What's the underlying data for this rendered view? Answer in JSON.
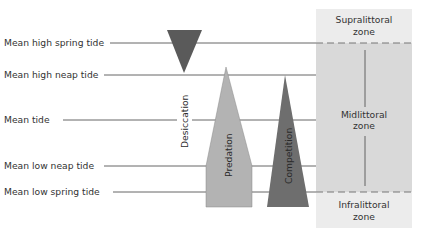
{
  "diagram": {
    "tide_levels": [
      {
        "label": "Mean high spring tide",
        "y": 43,
        "label_x": 4,
        "line_x1": 110
      },
      {
        "label": "Mean high neap tide",
        "y": 75,
        "label_x": 4,
        "line_x1": 104
      },
      {
        "label": "Mean tide",
        "y": 120,
        "label_x": 4,
        "line_x1": 63
      },
      {
        "label": "Mean low neap tide",
        "y": 166,
        "label_x": 4,
        "line_x1": 104
      },
      {
        "label": "Mean low spring tide",
        "y": 192,
        "label_x": 4,
        "line_x1": 113
      }
    ],
    "factors": [
      {
        "label": "Desiccation",
        "color": "#5a5a5a"
      },
      {
        "label": "Predation",
        "color": "#b3b3b3"
      },
      {
        "label": "Competition",
        "color": "#6e6e6e"
      }
    ],
    "zones": [
      {
        "name": "Supralittoral",
        "suffix": "zone"
      },
      {
        "name": "Midlittoral",
        "suffix": "zone"
      },
      {
        "name": "Infralittoral",
        "suffix": "zone"
      }
    ],
    "colors": {
      "zone_panel": "#e8e8e8",
      "mid_zone": "#d6d6d6",
      "line": "#555555",
      "dash": "#777777"
    }
  }
}
